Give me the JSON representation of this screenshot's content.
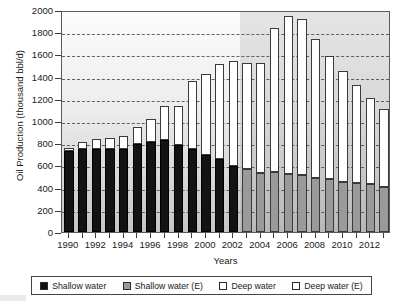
{
  "chart_data": {
    "type": "bar",
    "stacked": true,
    "title": "",
    "xlabel": "Years",
    "ylabel": "Oil Production (thousand bbl/d)",
    "ylim": [
      0,
      2000
    ],
    "ytick_step": 200,
    "yticks": [
      0,
      200,
      400,
      600,
      800,
      1000,
      1200,
      1400,
      1600,
      1800,
      2000
    ],
    "grid": "horizontal-dashed",
    "legend_position": "bottom",
    "categories": [
      "1990",
      "1991",
      "1992",
      "1993",
      "1994",
      "1995",
      "1996",
      "1997",
      "1998",
      "1999",
      "2000",
      "2001",
      "2002",
      "2003",
      "2004",
      "2005",
      "2006",
      "2007",
      "2008",
      "2009",
      "2010",
      "2011",
      "2012",
      "2013"
    ],
    "xtick_labels": [
      "1990",
      "1992",
      "1994",
      "1996",
      "1998",
      "2000",
      "2002",
      "2004",
      "2006",
      "2008",
      "2010",
      "2012"
    ],
    "series": [
      {
        "name": "Shallow water",
        "color": "#131313",
        "values": [
          730,
          750,
          745,
          750,
          750,
          795,
          815,
          825,
          785,
          745,
          690,
          660,
          595,
          null,
          null,
          null,
          null,
          null,
          null,
          null,
          null,
          null,
          null,
          null
        ]
      },
      {
        "name": "Shallow water (E)",
        "color": "#9a9a9a",
        "values": [
          null,
          null,
          null,
          null,
          null,
          null,
          null,
          null,
          null,
          null,
          null,
          null,
          null,
          570,
          530,
          545,
          525,
          510,
          490,
          475,
          455,
          445,
          430,
          410
        ]
      },
      {
        "name": "Deep water",
        "color": "#ffffff",
        "values": [
          30,
          65,
          95,
          100,
          115,
          155,
          200,
          310,
          350,
          615,
          735,
          850,
          945,
          null,
          null,
          null,
          null,
          null,
          null,
          null,
          null,
          null,
          null,
          null
        ]
      },
      {
        "name": "Deep water (E)",
        "color": "#ffffff",
        "values": [
          null,
          null,
          null,
          null,
          null,
          null,
          null,
          null,
          null,
          null,
          null,
          null,
          null,
          955,
          995,
          1290,
          1420,
          1405,
          1250,
          1115,
          995,
          875,
          775,
          695
        ]
      }
    ],
    "totals": [
      760,
      815,
      840,
      850,
      865,
      950,
      1015,
      1135,
      1135,
      1360,
      1425,
      1510,
      1540,
      1525,
      1525,
      1835,
      1945,
      1915,
      1740,
      1590,
      1450,
      1320,
      1205,
      1105
    ],
    "estimate_start_year": "2003"
  },
  "legend": {
    "items": [
      {
        "label": "Shallow water",
        "swatch": "black"
      },
      {
        "label": "Shallow water (E)",
        "swatch": "gray"
      },
      {
        "label": "Deep water",
        "swatch": "white"
      },
      {
        "label": "Deep water (E)",
        "swatch": "white"
      }
    ]
  }
}
